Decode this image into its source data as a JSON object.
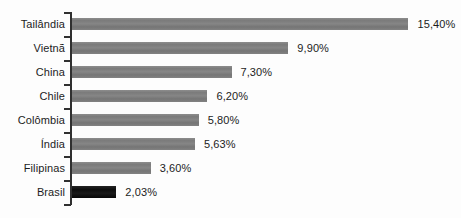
{
  "chart_data": {
    "type": "bar",
    "orientation": "horizontal",
    "title": "",
    "subtitle": "",
    "xlabel": "",
    "ylabel": "",
    "grid": false,
    "legend": null,
    "xlim": [
      0,
      15.4
    ],
    "categories": [
      "Tailândia",
      "Vietnã",
      "China",
      "Chile",
      "Colômbia",
      "Índia",
      "Filipinas",
      "Brasil"
    ],
    "values": [
      15.4,
      9.9,
      7.3,
      6.2,
      5.8,
      5.63,
      3.6,
      2.03
    ],
    "value_labels": [
      "15,40%",
      "9,90%",
      "7,30%",
      "6,20%",
      "5,80%",
      "5,63%",
      "3,60%",
      "2,03%"
    ],
    "bar_colors": [
      "#808080",
      "#808080",
      "#808080",
      "#808080",
      "#808080",
      "#808080",
      "#808080",
      "#141414"
    ],
    "highlighted_category": "Brasil",
    "axis_color": "#303030",
    "background_color": "#fdfdfd"
  },
  "series": [
    {
      "category": "Tailândia",
      "value": 15.4,
      "label": "15,40%",
      "color": "#808080"
    },
    {
      "category": "Vietnã",
      "value": 9.9,
      "label": "9,90%",
      "color": "#808080"
    },
    {
      "category": "China",
      "value": 7.3,
      "label": "7,30%",
      "color": "#808080"
    },
    {
      "category": "Chile",
      "value": 6.2,
      "label": "6,20%",
      "color": "#808080"
    },
    {
      "category": "Colômbia",
      "value": 5.8,
      "label": "5,80%",
      "color": "#808080"
    },
    {
      "category": "Índia",
      "value": 5.63,
      "label": "5,63%",
      "color": "#808080"
    },
    {
      "category": "Filipinas",
      "value": 3.6,
      "label": "3,60%",
      "color": "#808080"
    },
    {
      "category": "Brasil",
      "value": 2.03,
      "label": "2,03%",
      "color": "#141414"
    }
  ]
}
